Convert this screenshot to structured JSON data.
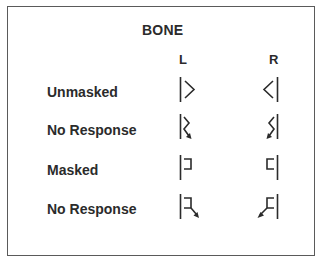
{
  "legend": {
    "title": "BONE",
    "columns": [
      "L",
      "R"
    ],
    "rows": [
      {
        "label": "Unmasked",
        "left_symbol": "bone-unmasked-left-icon",
        "right_symbol": "bone-unmasked-right-icon"
      },
      {
        "label": "No Response",
        "left_symbol": "bone-unmasked-no-response-left-icon",
        "right_symbol": "bone-unmasked-no-response-right-icon"
      },
      {
        "label": "Masked",
        "left_symbol": "bone-masked-left-icon",
        "right_symbol": "bone-masked-right-icon"
      },
      {
        "label": "No Response",
        "left_symbol": "bone-masked-no-response-left-icon",
        "right_symbol": "bone-masked-no-response-right-icon"
      }
    ]
  },
  "colors": {
    "ink": "#2b2b2b",
    "border": "#5a5a5a"
  }
}
